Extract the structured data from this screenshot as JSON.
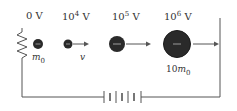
{
  "diagram": {
    "voltages": [
      {
        "base": "0",
        "exp": "",
        "unit": "V"
      },
      {
        "base": "10",
        "exp": "4",
        "unit": "V"
      },
      {
        "base": "10",
        "exp": "5",
        "unit": "V"
      },
      {
        "base": "10",
        "exp": "6",
        "unit": "V"
      }
    ],
    "labels": {
      "initial_mass": {
        "sym": "m",
        "sub": "0"
      },
      "velocity": "v",
      "final_mass": {
        "coef": "10",
        "sym": "m",
        "sub": "0"
      }
    },
    "particle_charge": "−",
    "colors": {
      "line": "#555555",
      "particle": "#2a2a2a",
      "text": "#333333"
    }
  }
}
